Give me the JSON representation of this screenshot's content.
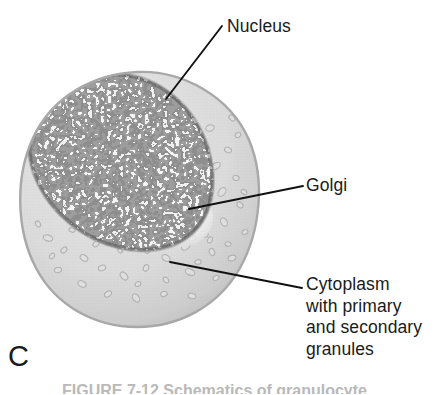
{
  "figure": {
    "panel_letter": "C",
    "caption": "FIGURE 7-12  Schematics of granulocyte",
    "background_color": "#ffffff",
    "text_color": "#1a1a1a"
  },
  "labels": {
    "nucleus": "Nucleus",
    "golgi": "Golgi",
    "cytoplasm": "Cytoplasm\nwith primary\nand secondary\ngranules"
  },
  "illustration": {
    "name": "granulocyte-cell-diagram",
    "cell": {
      "center_x": 137,
      "center_y": 190,
      "radius": 118,
      "membrane_color": "#c9c9c9",
      "cytoplasm_color": "#e2e2e2"
    },
    "nucleus": {
      "center_x": 120,
      "center_y": 163,
      "radius_x": 98,
      "radius_y": 92,
      "chromatin_dark": "#4e4e4e",
      "chromatin_light": "#ececec"
    },
    "golgi": {
      "center_x": 186,
      "center_y": 212,
      "color": "#efefef"
    },
    "granules": {
      "outline_color": "#b0b0b0",
      "fill_color": "#e9e9e9",
      "count": 96
    }
  },
  "leader_lines": [
    {
      "name": "nucleus",
      "x1": 222,
      "y1": 26,
      "x2": 166,
      "y2": 99
    },
    {
      "name": "golgi",
      "x1": 303,
      "y1": 186,
      "x2": 189,
      "y2": 209
    },
    {
      "name": "cytoplasm",
      "x1": 302,
      "y1": 288,
      "x2": 170,
      "y2": 262
    }
  ]
}
